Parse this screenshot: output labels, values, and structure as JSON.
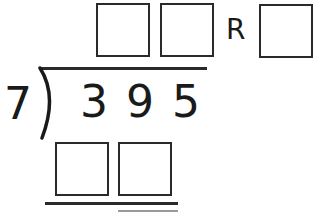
{
  "problem": {
    "divisor": "7",
    "dividend": "3 9 5",
    "remainder_label": "R",
    "quotient_boxes": [
      "",
      ""
    ],
    "remainder_box": "",
    "work_boxes": [
      "",
      ""
    ]
  }
}
